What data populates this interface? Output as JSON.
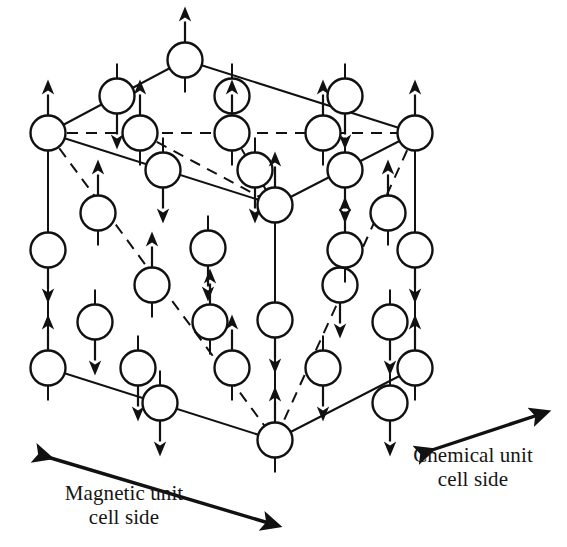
{
  "figure": {
    "type": "crystal-magnetic-structure-diagram",
    "background_color": "#ffffff",
    "line_color": "#111111",
    "circle_fill": "#ffffff",
    "circle_stroke": "#111111"
  },
  "labels": {
    "magnetic": {
      "text": "Magnetic unit\ncell side",
      "line1": "Magnetic unit",
      "line2": "cell side"
    },
    "chemical": {
      "text": "Chemical unit\ncell side",
      "line1": "Chemical unit",
      "line2": "cell side"
    }
  },
  "measure_arrows": [
    {
      "name": "magnetic-unit-cell-arrow",
      "style": "double-headed",
      "x1": 44,
      "y1": 456,
      "x2": 272,
      "y2": 524,
      "spans": "full cube front-bottom-left edge"
    },
    {
      "name": "chemical-unit-cell-arrow",
      "style": "double-headed",
      "x1": 426,
      "y1": 450,
      "x2": 540,
      "y2": 415,
      "spans": "half cube front-bottom-right edge"
    }
  ],
  "geometry": {
    "cube_vertices": {
      "top_back": {
        "x": 185,
        "y": 60
      },
      "left": {
        "x": 48,
        "y": 133
      },
      "right": {
        "x": 415,
        "y": 133
      },
      "front_top": {
        "x": 275,
        "y": 205
      },
      "bottom_left": {
        "x": 48,
        "y": 368
      },
      "bottom_right": {
        "x": 415,
        "y": 368
      },
      "bottom_front": {
        "x": 275,
        "y": 440
      }
    },
    "edges_solid": [
      {
        "from": "left",
        "to": "top_back"
      },
      {
        "from": "top_back",
        "to": "right"
      },
      {
        "from": "left",
        "to": "front_top"
      },
      {
        "from": "front_top",
        "to": "right"
      },
      {
        "from": "left",
        "to": "bottom_left"
      },
      {
        "from": "right",
        "to": "bottom_right"
      },
      {
        "from": "bottom_left",
        "to": "bottom_front"
      },
      {
        "from": "bottom_front",
        "to": "bottom_right"
      }
    ],
    "edges_dashed": [
      {
        "from": "left",
        "to": "right",
        "note": "hidden back horizontal"
      },
      {
        "from": "left",
        "to": "bottom_front",
        "note": "hidden body diagonal/edge"
      },
      {
        "from": "right",
        "to": "bottom_front",
        "note": "hidden body diagonal/edge"
      },
      {
        "from": "front_top",
        "to": "bottom_front",
        "note": "hidden vertical through body centre",
        "solid": true
      }
    ]
  },
  "chart_data": {
    "type": "scatter",
    "xlabel": "",
    "ylabel": "",
    "spin_up_symbol": "up-arrow",
    "spin_down_symbol": "down-arrow",
    "counts": {
      "total_atoms": 39,
      "spin_up": 20,
      "spin_down": 19
    },
    "atoms": [
      {
        "id": 1,
        "x": 185,
        "y": 60,
        "spin": "up",
        "row": "top-vertex"
      },
      {
        "id": 2,
        "x": 117,
        "y": 96,
        "spin": "down",
        "row": "top-back-edge"
      },
      {
        "id": 3,
        "x": 232,
        "y": 96,
        "spin": "down",
        "row": "top-back-edge"
      },
      {
        "id": 4,
        "x": 345,
        "y": 96,
        "spin": "down",
        "row": "top-back-edge"
      },
      {
        "id": 5,
        "x": 48,
        "y": 133,
        "spin": "up",
        "row": "back-top-row"
      },
      {
        "id": 6,
        "x": 140,
        "y": 133,
        "spin": "up",
        "row": "back-top-row"
      },
      {
        "id": 7,
        "x": 232,
        "y": 133,
        "spin": "up",
        "row": "back-top-row"
      },
      {
        "id": 8,
        "x": 323,
        "y": 133,
        "spin": "up",
        "row": "back-top-row"
      },
      {
        "id": 9,
        "x": 415,
        "y": 133,
        "spin": "up",
        "row": "back-top-row"
      },
      {
        "id": 10,
        "x": 163,
        "y": 170,
        "spin": "down",
        "row": "top-face-mid"
      },
      {
        "id": 11,
        "x": 255,
        "y": 170,
        "spin": "down",
        "row": "top-face-mid"
      },
      {
        "id": 12,
        "x": 345,
        "y": 170,
        "spin": "down",
        "row": "top-face-mid"
      },
      {
        "id": 13,
        "x": 275,
        "y": 205,
        "spin": "up",
        "row": "front-top-vertex"
      },
      {
        "id": 14,
        "x": 98,
        "y": 213,
        "spin": "up",
        "row": "left-face-upper"
      },
      {
        "id": 15,
        "x": 208,
        "y": 248,
        "spin": "down",
        "row": "left-face-upper"
      },
      {
        "id": 16,
        "x": 388,
        "y": 213,
        "spin": "up",
        "row": "right-face-upper"
      },
      {
        "id": 17,
        "x": 48,
        "y": 250,
        "spin": "down",
        "row": "left-edge-mid"
      },
      {
        "id": 18,
        "x": 415,
        "y": 250,
        "spin": "down",
        "row": "right-edge-mid"
      },
      {
        "id": 19,
        "x": 152,
        "y": 285,
        "spin": "up",
        "row": "left-face-centre"
      },
      {
        "id": 20,
        "x": 275,
        "y": 320,
        "spin": "down",
        "row": "body-centre-column"
      },
      {
        "id": 21,
        "x": 340,
        "y": 285,
        "spin": "down",
        "row": "right-face-centre"
      },
      {
        "id": 22,
        "x": 95,
        "y": 322,
        "spin": "down",
        "row": "left-face-lower"
      },
      {
        "id": 23,
        "x": 390,
        "y": 322,
        "spin": "down",
        "row": "right-face-lower"
      },
      {
        "id": 24,
        "x": 210,
        "y": 322,
        "spin": "up",
        "row": "interior"
      },
      {
        "id": 25,
        "x": 345,
        "y": 250,
        "spin": "up",
        "row": "interior"
      },
      {
        "id": 26,
        "x": 48,
        "y": 368,
        "spin": "up",
        "row": "bottom-back-row"
      },
      {
        "id": 27,
        "x": 160,
        "y": 403,
        "spin": "down",
        "row": "bottom-front-edge"
      },
      {
        "id": 28,
        "x": 275,
        "y": 440,
        "spin": "up",
        "row": "bottom-front-vertex"
      },
      {
        "id": 29,
        "x": 390,
        "y": 403,
        "spin": "down",
        "row": "bottom-front-edge"
      },
      {
        "id": 30,
        "x": 415,
        "y": 368,
        "spin": "up",
        "row": "bottom-back-row"
      },
      {
        "id": 31,
        "x": 232,
        "y": 368,
        "spin": "up",
        "row": "bottom-interior"
      },
      {
        "id": 32,
        "x": 138,
        "y": 368,
        "spin": "down",
        "row": "bottom-interior"
      },
      {
        "id": 33,
        "x": 323,
        "y": 368,
        "spin": "down",
        "row": "bottom-interior"
      }
    ]
  }
}
